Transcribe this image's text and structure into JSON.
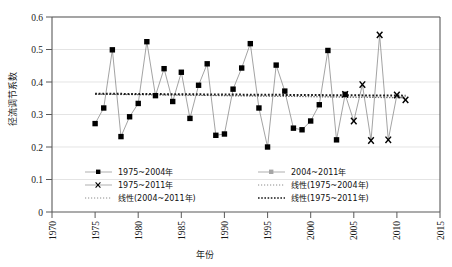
{
  "chart_data": {
    "type": "line",
    "title": "",
    "xlabel": "年份",
    "ylabel": "径流调节系数",
    "xlim": [
      1970,
      2015
    ],
    "ylim": [
      0,
      0.6
    ],
    "xticks": [
      "1970",
      "1975",
      "1980",
      "1985",
      "1990",
      "1995",
      "2000",
      "2005",
      "2010",
      "2015"
    ],
    "xtick_values": [
      1970,
      1975,
      1980,
      1985,
      1990,
      1995,
      2000,
      2005,
      2010,
      2015
    ],
    "yticks": [
      "0",
      "0.1",
      "0.2",
      "0.3",
      "0.4",
      "0.5",
      "0.6"
    ],
    "ytick_values": [
      0,
      0.1,
      0.2,
      0.3,
      0.4,
      0.5,
      0.6
    ],
    "grid": "horizontal",
    "legend_position": "inside-bottom",
    "series": [
      {
        "name": "1975~2004年",
        "marker": "filled-square",
        "x": [
          1975,
          1976,
          1977,
          1978,
          1979,
          1980,
          1981,
          1982,
          1983,
          1984,
          1985,
          1986,
          1987,
          1988,
          1989,
          1990,
          1991,
          1992,
          1993,
          1994,
          1995,
          1996,
          1997,
          1998,
          1999,
          2000,
          2001,
          2002,
          2003,
          2004
        ],
        "values": [
          0.272,
          0.32,
          0.499,
          0.232,
          0.293,
          0.334,
          0.524,
          0.358,
          0.441,
          0.34,
          0.43,
          0.288,
          0.39,
          0.456,
          0.236,
          0.24,
          0.378,
          0.443,
          0.518,
          0.32,
          0.2,
          0.452,
          0.372,
          0.258,
          0.253,
          0.28,
          0.33,
          0.497,
          0.222,
          0.362
        ]
      },
      {
        "name": "2004~2011年",
        "marker": "x-cross",
        "x": [
          2004,
          2005,
          2006,
          2007,
          2008,
          2009,
          2010,
          2011
        ],
        "values": [
          0.362,
          0.28,
          0.392,
          0.22,
          0.545,
          0.222,
          0.36,
          0.345
        ]
      }
    ],
    "trendlines": [
      {
        "name": "线性(2004~2011年)",
        "style": "dotted-fine",
        "x_start": 1975,
        "x_end": 2011,
        "y_start": 0.363,
        "y_end": 0.351
      },
      {
        "name": "线性(1975~2004年)",
        "style": "dotted-fine",
        "x_start": 1975,
        "x_end": 2011,
        "y_start": 0.362,
        "y_end": 0.352
      },
      {
        "name": "线性(1975~2011年)",
        "style": "dotted-bold",
        "x_start": 1975,
        "x_end": 2011,
        "y_start": 0.364,
        "y_end": 0.358
      }
    ]
  },
  "legend": {
    "items": [
      {
        "label": "1975~2004年",
        "type": "line-marker",
        "marker": "filled-circle"
      },
      {
        "label": "2004~2011年",
        "type": "line-marker",
        "marker": "filled-circle"
      },
      {
        "label": "1975~2011年",
        "type": "line-marker",
        "marker": "x-cross"
      },
      {
        "label": "线性(1975~2004年)",
        "type": "dotted-fine"
      },
      {
        "label": "线性(2004~2011年)",
        "type": "dotted-fine"
      },
      {
        "label": "线性(1975~2011年)",
        "type": "dotted-bold"
      }
    ]
  },
  "colors": {
    "axis": "#595959",
    "grid": "#d9d9d9",
    "marker": "#000000",
    "series_line": "#808080",
    "text": "#1a1a1a"
  }
}
